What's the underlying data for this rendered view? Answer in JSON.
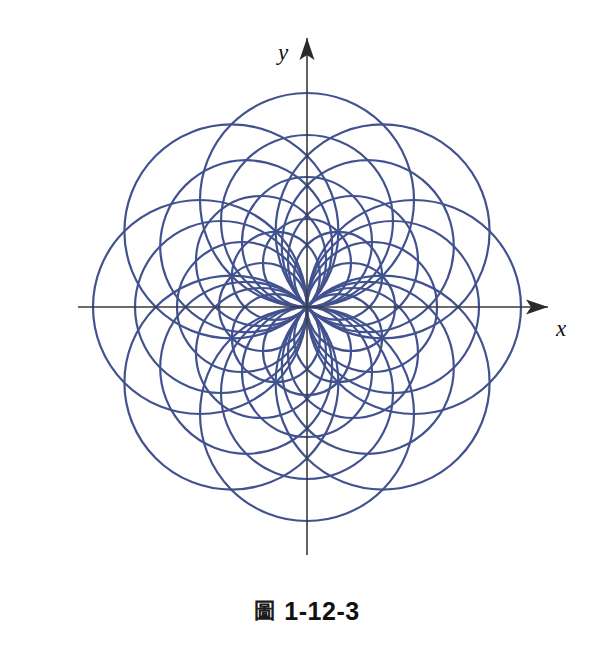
{
  "figure": {
    "caption_symbol": "圖",
    "caption_number": "1-12-3",
    "caption_symbol_name": "figure-cjk-glyph",
    "x_axis_label": "x",
    "y_axis_label": "y",
    "curve_color": "#41528f",
    "axis_color": "#3a3a3a",
    "background_color": "#ffffff",
    "stroke_width": 2.2
  },
  "chart_data": {
    "type": "line",
    "title": "",
    "subtitle": "",
    "xlabel": "x",
    "ylabel": "y",
    "legend": [],
    "grid": false,
    "axes": {
      "origin_px": [
        307,
        307
      ],
      "xlim": [
        -240,
        240
      ],
      "ylim": [
        -240,
        240
      ],
      "x_axis_arrow": true,
      "y_axis_arrow": true,
      "ticks": [],
      "tick_labels": []
    },
    "curve_family": "r = a*cos(theta - phi)",
    "diameters_px": [
      214,
      172,
      130,
      88
    ],
    "direction_angles_deg": [
      0,
      45,
      90,
      135,
      180,
      225,
      270,
      315
    ],
    "circle_count": 32,
    "circles": [
      {
        "phi_deg": 0,
        "diameter_px": 214,
        "center_px": [
          414,
          307
        ],
        "radius_px": 107
      },
      {
        "phi_deg": 0,
        "diameter_px": 172,
        "center_px": [
          393,
          307
        ],
        "radius_px": 86
      },
      {
        "phi_deg": 0,
        "diameter_px": 130,
        "center_px": [
          372,
          307
        ],
        "radius_px": 65
      },
      {
        "phi_deg": 0,
        "diameter_px": 88,
        "center_px": [
          351,
          307
        ],
        "radius_px": 44
      },
      {
        "phi_deg": 45,
        "diameter_px": 214,
        "center_px": [
          382.6,
          231.4
        ],
        "radius_px": 107
      },
      {
        "phi_deg": 45,
        "diameter_px": 172,
        "center_px": [
          367.8,
          246.2
        ],
        "radius_px": 86
      },
      {
        "phi_deg": 45,
        "diameter_px": 130,
        "center_px": [
          353.0,
          261.0
        ],
        "radius_px": 65
      },
      {
        "phi_deg": 45,
        "diameter_px": 88,
        "center_px": [
          338.1,
          275.9
        ],
        "radius_px": 44
      },
      {
        "phi_deg": 90,
        "diameter_px": 214,
        "center_px": [
          307,
          200
        ],
        "radius_px": 107
      },
      {
        "phi_deg": 90,
        "diameter_px": 172,
        "center_px": [
          307,
          221
        ],
        "radius_px": 86
      },
      {
        "phi_deg": 90,
        "diameter_px": 130,
        "center_px": [
          307,
          242
        ],
        "radius_px": 65
      },
      {
        "phi_deg": 90,
        "diameter_px": 88,
        "center_px": [
          307,
          263
        ],
        "radius_px": 44
      },
      {
        "phi_deg": 135,
        "diameter_px": 214,
        "center_px": [
          231.4,
          231.4
        ],
        "radius_px": 107
      },
      {
        "phi_deg": 135,
        "diameter_px": 172,
        "center_px": [
          246.2,
          246.2
        ],
        "radius_px": 86
      },
      {
        "phi_deg": 135,
        "diameter_px": 130,
        "center_px": [
          261.0,
          261.0
        ],
        "radius_px": 65
      },
      {
        "phi_deg": 135,
        "diameter_px": 88,
        "center_px": [
          275.9,
          275.9
        ],
        "radius_px": 44
      },
      {
        "phi_deg": 180,
        "diameter_px": 214,
        "center_px": [
          200,
          307
        ],
        "radius_px": 107
      },
      {
        "phi_deg": 180,
        "diameter_px": 172,
        "center_px": [
          221,
          307
        ],
        "radius_px": 86
      },
      {
        "phi_deg": 180,
        "diameter_px": 130,
        "center_px": [
          242,
          307
        ],
        "radius_px": 65
      },
      {
        "phi_deg": 180,
        "diameter_px": 88,
        "center_px": [
          263,
          307
        ],
        "radius_px": 44
      },
      {
        "phi_deg": 225,
        "diameter_px": 214,
        "center_px": [
          231.4,
          382.6
        ],
        "radius_px": 107
      },
      {
        "phi_deg": 225,
        "diameter_px": 172,
        "center_px": [
          246.2,
          367.8
        ],
        "radius_px": 86
      },
      {
        "phi_deg": 225,
        "diameter_px": 130,
        "center_px": [
          261.0,
          353.0
        ],
        "radius_px": 65
      },
      {
        "phi_deg": 225,
        "diameter_px": 88,
        "center_px": [
          275.9,
          338.1
        ],
        "radius_px": 44
      },
      {
        "phi_deg": 270,
        "diameter_px": 214,
        "center_px": [
          307,
          414
        ],
        "radius_px": 107
      },
      {
        "phi_deg": 270,
        "diameter_px": 172,
        "center_px": [
          307,
          393
        ],
        "radius_px": 86
      },
      {
        "phi_deg": 270,
        "diameter_px": 130,
        "center_px": [
          307,
          372
        ],
        "radius_px": 65
      },
      {
        "phi_deg": 270,
        "diameter_px": 88,
        "center_px": [
          307,
          351
        ],
        "radius_px": 44
      },
      {
        "phi_deg": 315,
        "diameter_px": 214,
        "center_px": [
          382.6,
          382.6
        ],
        "radius_px": 107
      },
      {
        "phi_deg": 315,
        "diameter_px": 172,
        "center_px": [
          367.8,
          367.8
        ],
        "radius_px": 86
      },
      {
        "phi_deg": 315,
        "diameter_px": 130,
        "center_px": [
          353.0,
          353.0
        ],
        "radius_px": 65
      },
      {
        "phi_deg": 315,
        "diameter_px": 88,
        "center_px": [
          338.1,
          338.1
        ],
        "radius_px": 44
      }
    ]
  }
}
